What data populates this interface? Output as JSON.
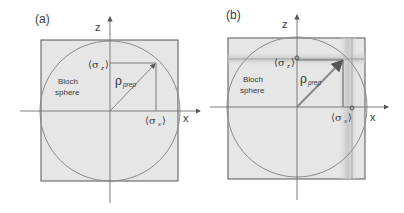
{
  "panels": [
    {
      "id": "a",
      "label": "(a)",
      "axis_z": "z",
      "axis_x": "x",
      "sphere_label_line1": "Bloch",
      "sphere_label_line2": "sphere",
      "rho_symbol": "ρ",
      "rho_sub": "prep",
      "sigma_z_left": "⟨σ",
      "sigma_z_sub": "z",
      "sigma_x_left": "⟨σ",
      "sigma_x_sub": "x",
      "angle_bracket_close": "⟩"
    },
    {
      "id": "b",
      "label": "(b)",
      "axis_z": "z",
      "axis_x": "x",
      "sphere_label_line1": "Bloch",
      "sphere_label_line2": "sphere",
      "rho_symbol": "ρ",
      "rho_sub": "prep",
      "sigma_z_left": "⟨σ",
      "sigma_z_sub": "z",
      "sigma_x_left": "⟨σ",
      "sigma_x_sub": "x",
      "angle_bracket_close": "⟩"
    }
  ],
  "colors": {
    "square_fill": "#e6e6e6",
    "line": "#707070",
    "circle": "#8a8a8a",
    "text": "#3a3a3a"
  }
}
